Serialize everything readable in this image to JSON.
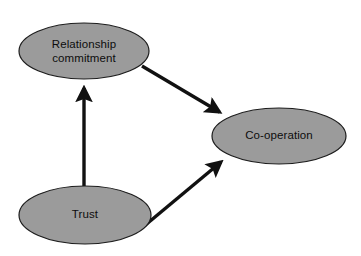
{
  "diagram": {
    "type": "path-diagram",
    "background_color": "#ffffff",
    "node_fill_color": "#9b9b9b",
    "node_stroke_color": "#1c1c1c",
    "edge_color": "#111111",
    "text_color": "#0d0d0d",
    "nodes": [
      {
        "id": "relationship-commitment",
        "label_line1": "Relationship",
        "label_line2": "commitment",
        "shape": "ellipse",
        "cx": 84,
        "cy": 51,
        "rx": 65,
        "ry": 28
      },
      {
        "id": "co-operation",
        "label_line1": "Co-operation",
        "label_line2": "",
        "shape": "ellipse",
        "cx": 279,
        "cy": 136,
        "rx": 67,
        "ry": 28
      },
      {
        "id": "trust",
        "label_line1": "Trust",
        "label_line2": "",
        "shape": "ellipse",
        "cx": 85,
        "cy": 215,
        "rx": 66,
        "ry": 29
      }
    ],
    "edges": [
      {
        "id": "trust-to-relationship-commitment",
        "from": "trust",
        "to": "relationship-commitment",
        "label": "",
        "direction": "up",
        "x1": 84,
        "y1": 186,
        "x2": 84,
        "y2": 82
      },
      {
        "id": "relationship-commitment-to-co-operation",
        "from": "relationship-commitment",
        "to": "co-operation",
        "label": "",
        "direction": "down-right",
        "x1": 142,
        "y1": 66,
        "x2": 224,
        "y2": 115
      },
      {
        "id": "trust-to-co-operation",
        "from": "trust",
        "to": "co-operation",
        "label": "",
        "direction": "up-right",
        "x1": 143,
        "y1": 227,
        "x2": 226,
        "y2": 159
      }
    ]
  }
}
